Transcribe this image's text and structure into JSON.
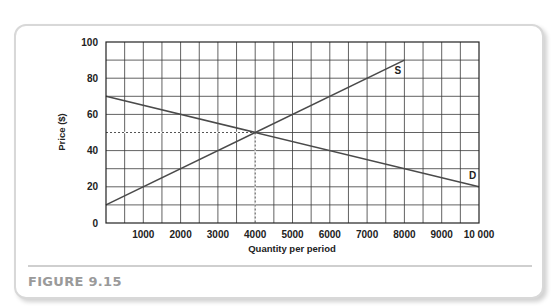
{
  "figure": {
    "caption": "FIGURE 9.15"
  },
  "chart_data": {
    "type": "line",
    "title": "",
    "xlabel": "Quantity per period",
    "ylabel": "Price ($)",
    "xlim": [
      0,
      10000
    ],
    "ylim": [
      0,
      100
    ],
    "grid": true,
    "grid_x_step": 500,
    "grid_y_step": 10,
    "x_ticks": [
      1000,
      2000,
      3000,
      4000,
      5000,
      6000,
      7000,
      8000,
      9000,
      10000
    ],
    "x_tick_labels": [
      "1000",
      "2000",
      "3000",
      "4000",
      "5000",
      "6000",
      "7000",
      "8000",
      "9000",
      "10 000"
    ],
    "y_ticks": [
      0,
      20,
      40,
      60,
      80,
      100
    ],
    "y_tick_labels": [
      "0",
      "20",
      "40",
      "60",
      "80",
      "100"
    ],
    "series": [
      {
        "name": "S",
        "label": "S",
        "points": [
          [
            0,
            10
          ],
          [
            8000,
            90
          ]
        ]
      },
      {
        "name": "D",
        "label": "D",
        "points": [
          [
            0,
            70
          ],
          [
            10000,
            20
          ]
        ]
      }
    ],
    "annotations": [
      {
        "type": "dashed-guide",
        "x": 4000,
        "y": 50,
        "note": "equilibrium"
      }
    ],
    "legend": "none (inline labels S and D)"
  }
}
